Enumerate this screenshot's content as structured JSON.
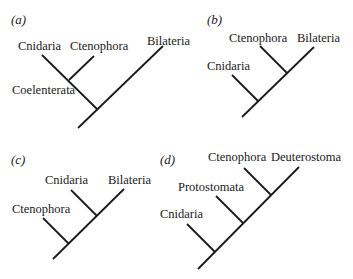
{
  "figure": {
    "panels": [
      {
        "id": "a",
        "label": "(a)",
        "taxa": [
          "Cnidaria",
          "Ctenophora",
          "Bilateria"
        ],
        "clade_label": "Coelenterata",
        "topology": "((Cnidaria, Ctenophora)Coelenterata, Bilateria)"
      },
      {
        "id": "b",
        "label": "(b)",
        "taxa": [
          "Cnidaria",
          "Ctenophora",
          "Bilateria"
        ],
        "topology": "(Cnidaria, (Ctenophora, Bilateria))"
      },
      {
        "id": "c",
        "label": "(c)",
        "taxa": [
          "Ctenophora",
          "Cnidaria",
          "Bilateria"
        ],
        "topology": "(Ctenophora, (Cnidaria, Bilateria))"
      },
      {
        "id": "d",
        "label": "(d)",
        "taxa": [
          "Cnidaria",
          "Protostomata",
          "Ctenophora",
          "Deuterostoma"
        ],
        "topology": "(Cnidaria, (Protostomata, (Ctenophora, Deuterostoma)))"
      }
    ]
  },
  "a": {
    "label": "(a)",
    "cnidaria": "Cnidaria",
    "ctenophora": "Ctenophora",
    "bilateria": "Bilateria",
    "coelenterata": "Coelenterata"
  },
  "b": {
    "label": "(b)",
    "cnidaria": "Cnidaria",
    "ctenophora": "Ctenophora",
    "bilateria": "Bilateria"
  },
  "c": {
    "label": "(c)",
    "cnidaria": "Cnidaria",
    "ctenophora": "Ctenophora",
    "bilateria": "Bilateria"
  },
  "d": {
    "label": "(d)",
    "cnidaria": "Cnidaria",
    "protostomata": "Protostomata",
    "ctenophora": "Ctenophora",
    "deuterostoma": "Deuterostoma"
  }
}
